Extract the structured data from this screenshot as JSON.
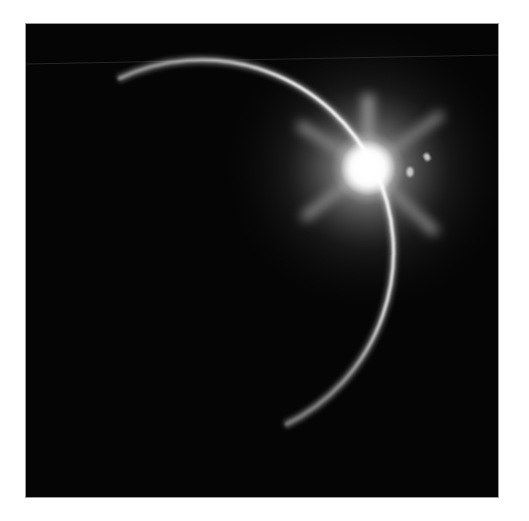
{
  "image": {
    "subject": "eclipse-crescent-with-sun-flare",
    "colors": {
      "page_background": "#ffffff",
      "sky": "#050505",
      "arc": "#ffffff",
      "flare": "#ffffff"
    }
  }
}
